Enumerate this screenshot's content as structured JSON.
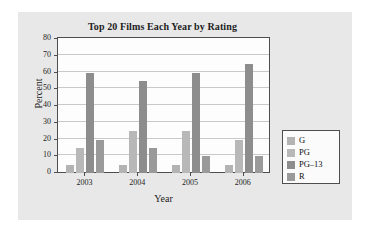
{
  "chart_data": {
    "type": "bar",
    "title": "Top 20 Films Each Year by Rating",
    "xlabel": "Year",
    "ylabel": "Percent",
    "categories": [
      "2003",
      "2004",
      "2005",
      "2006"
    ],
    "series": [
      {
        "name": "G",
        "values": [
          5,
          5,
          5,
          4.5
        ],
        "color": "#b3b3b3"
      },
      {
        "name": "PG",
        "values": [
          15,
          25,
          25,
          20
        ],
        "color": "#b8b8b8"
      },
      {
        "name": "PG–13",
        "values": [
          60,
          55,
          60,
          65
        ],
        "color": "#8d8d8d"
      },
      {
        "name": "R",
        "values": [
          20,
          15,
          10,
          10
        ],
        "color": "#9a9a9a"
      }
    ],
    "ylim": [
      0,
      80
    ],
    "yticks": [
      0,
      10,
      20,
      30,
      40,
      50,
      60,
      70,
      80
    ],
    "ytick_labels": [
      "0",
      "10",
      "20",
      "30",
      "40",
      "50",
      "60",
      "70",
      "80"
    ],
    "grid": true,
    "legend_position": "right",
    "legend_entries": [
      "G",
      "PG",
      "PG–13",
      "R"
    ]
  },
  "figure": {
    "panel_color": "#e8e8e8",
    "plot_background": "#fdfdfd",
    "axis_color": "#4e4e4e",
    "grid_color": "#c9c9c9",
    "text_color": "#1d1d1d"
  }
}
